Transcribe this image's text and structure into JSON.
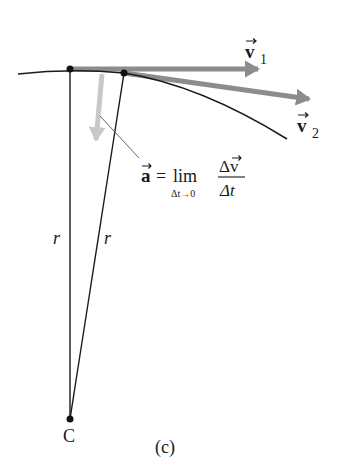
{
  "figure": {
    "panel_label": "(c)",
    "center_label": "C",
    "radius_label_left": "r",
    "radius_label_right": "r",
    "velocity_1": {
      "symbol": "v",
      "subscript": "1"
    },
    "velocity_2": {
      "symbol": "v",
      "subscript": "2"
    },
    "acceleration_formula": {
      "lhs": "a",
      "equals": "=",
      "lim": "lim",
      "lim_sub": "Δt→0",
      "numerator": "Δv",
      "denominator": "Δt"
    }
  },
  "colors": {
    "curve": "#1a1a1a",
    "velocity_arrow": "#8c8c8c",
    "delta_v_arrow": "#c8c8c8",
    "radius_line": "#1a1a1a",
    "background": "#ffffff"
  }
}
